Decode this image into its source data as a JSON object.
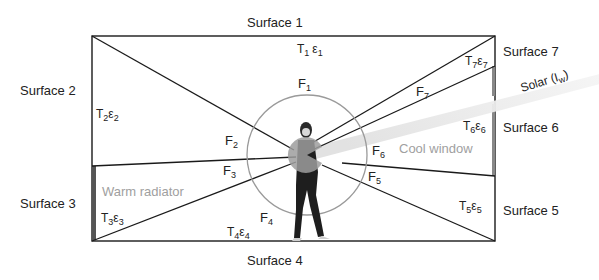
{
  "surfaces": {
    "s1": "Surface 1",
    "s2": "Surface 2",
    "s3": "Surface 3",
    "s4": "Surface 4",
    "s5": "Surface 5",
    "s6": "Surface 6",
    "s7": "Surface 7"
  },
  "properties": {
    "t1": {
      "T": "T",
      "sub": "1",
      "e": "ε",
      "esub": "1"
    },
    "t2": {
      "T": "T",
      "sub": "2",
      "e": "ε",
      "esub": "2"
    },
    "t3": {
      "T": "T",
      "sub": "3",
      "e": "ε",
      "esub": "3"
    },
    "t4": {
      "T": "T",
      "sub": "4",
      "e": "ε",
      "esub": "4"
    },
    "t5": {
      "T": "T",
      "sub": "5",
      "e": "ε",
      "esub": "5"
    },
    "t6": {
      "T": "T",
      "sub": "6",
      "e": "ε",
      "esub": "6"
    },
    "t7": {
      "T": "T",
      "sub": "7",
      "e": "ε",
      "esub": "7"
    }
  },
  "view_factors": {
    "f1": {
      "F": "F",
      "sub": "1"
    },
    "f2": {
      "F": "F",
      "sub": "2"
    },
    "f3": {
      "F": "F",
      "sub": "3"
    },
    "f4": {
      "F": "F",
      "sub": "4"
    },
    "f5": {
      "F": "F",
      "sub": "5"
    },
    "f6": {
      "F": "F",
      "sub": "6"
    },
    "f7": {
      "F": "F",
      "sub": "7"
    }
  },
  "annotations": {
    "radiator": "Warm radiator",
    "window": "Cool window",
    "solar": "Solar (I",
    "solar_sub": "w",
    "solar_close": ")"
  },
  "colors": {
    "line": "#1a1a1a",
    "circle": "#999999",
    "radiator": "#555555",
    "window": "#888888",
    "gray_text": "#a0a0a0"
  }
}
